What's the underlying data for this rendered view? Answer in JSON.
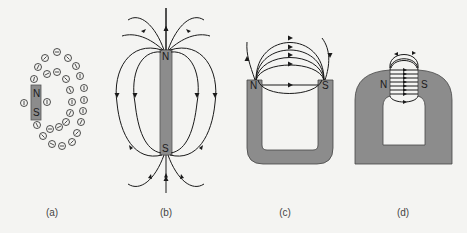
{
  "figure": {
    "panels": [
      {
        "id": "a",
        "caption": "(a)",
        "description": "Compass needles arranged around a bar magnet",
        "north_label": "N",
        "south_label": "S"
      },
      {
        "id": "b",
        "caption": "(b)",
        "description": "Magnetic field lines of a bar magnet",
        "north_label": "N",
        "south_label": "S"
      },
      {
        "id": "c",
        "caption": "(c)",
        "description": "Magnetic field lines of a horseshoe magnet",
        "north_label": "N",
        "south_label": "S"
      },
      {
        "id": "d",
        "caption": "(d)",
        "description": "Magnet with narrow gap, concentrated field lines",
        "north_label": "N",
        "south_label": "S"
      }
    ],
    "colors": {
      "background": "#f4f4f2",
      "magnet_fill": "#8c8c8c",
      "line": "#1a1a1a"
    }
  }
}
